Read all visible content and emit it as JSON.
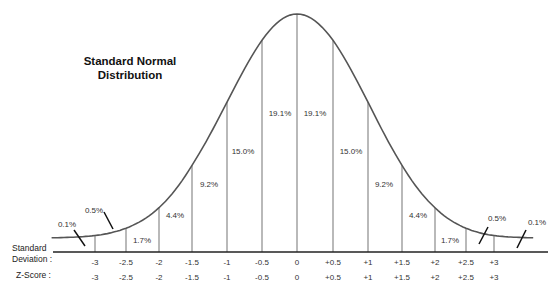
{
  "title_line1": "Standard Normal",
  "title_line2": "Distribution",
  "axis_labels": {
    "std_dev_line1": "Standard",
    "std_dev_line2": "Deviation :",
    "z_score": "Z-Score :"
  },
  "colors": {
    "curve": "#555555",
    "verticals": "#8a8a8a",
    "axis": "#222222",
    "text": "#333333"
  },
  "chart_data": {
    "type": "area",
    "title": "Standard Normal Distribution",
    "xlabel": "Standard Deviation / Z-Score",
    "ylabel": "",
    "x_ticks": [
      "-3",
      "-2.5",
      "-2",
      "-1.5",
      "-1",
      "-0.5",
      "0",
      "+0.5",
      "+1",
      "+1.5",
      "+2",
      "+2.5",
      "+3"
    ],
    "std_dev_labels": [
      "-3",
      "-2.5",
      "-2",
      "-1.5",
      "-1",
      "-0.5",
      "0",
      "+0.5",
      "+1",
      "+1.5",
      "+2",
      "+2.5",
      "+3"
    ],
    "z_score_labels": [
      "-3",
      "-2.5",
      "-2",
      "-1.5",
      "-1",
      "-0.5",
      "0",
      "+0.5",
      "+1",
      "+1.5",
      "+2",
      "+2.5",
      "+3"
    ],
    "segments": [
      {
        "range": "< -3",
        "percent": "0.1%"
      },
      {
        "range": "-3 to -2.5",
        "percent": "0.5%"
      },
      {
        "range": "-2.5 to -2",
        "percent": "1.7%"
      },
      {
        "range": "-2 to -1.5",
        "percent": "4.4%"
      },
      {
        "range": "-1.5 to -1",
        "percent": "9.2%"
      },
      {
        "range": "-1 to -0.5",
        "percent": "15.0%"
      },
      {
        "range": "-0.5 to 0",
        "percent": "19.1%"
      },
      {
        "range": "0 to +0.5",
        "percent": "19.1%"
      },
      {
        "range": "+0.5 to +1",
        "percent": "15.0%"
      },
      {
        "range": "+1 to +1.5",
        "percent": "9.2%"
      },
      {
        "range": "+1.5 to +2",
        "percent": "4.4%"
      },
      {
        "range": "+2 to +2.5",
        "percent": "1.7%"
      },
      {
        "range": "+2.5 to +3",
        "percent": "0.5%"
      },
      {
        "range": "> +3",
        "percent": "0.1%"
      }
    ],
    "values": [
      0.1,
      0.5,
      1.7,
      4.4,
      9.2,
      15.0,
      19.1,
      19.1,
      15.0,
      9.2,
      4.4,
      1.7,
      0.5,
      0.1
    ],
    "xlim": [
      -3.5,
      3.5
    ],
    "grid": false,
    "legend": "none"
  }
}
